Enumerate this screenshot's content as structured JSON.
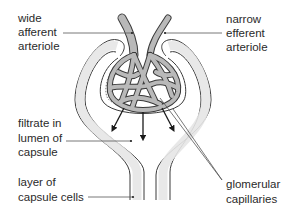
{
  "diagram": {
    "labels": {
      "afferent": [
        "wide",
        "afferent",
        "arteriole"
      ],
      "efferent": [
        "narrow",
        "efferent",
        "arteriole"
      ],
      "filtrate": [
        "filtrate in",
        "lumen of",
        "capsule"
      ],
      "capsule_cells": [
        "layer of",
        "capsule cells"
      ],
      "glomerular": [
        "glomerular",
        "capillaries"
      ]
    },
    "colors": {
      "vessel_fill": "#b9b9b9",
      "vessel_stroke": "#3a3a3a",
      "capsule_fill": "#e6e6e6",
      "line": "#444444",
      "text": "#2a2a2a"
    }
  }
}
